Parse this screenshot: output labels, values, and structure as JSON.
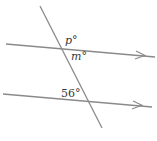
{
  "figure": {
    "type": "parallel-lines-transversal",
    "line_color": "#8a8a8a",
    "text_color": "#3a3a3a",
    "labels": {
      "p": "p°",
      "m": "m°",
      "given": "56°"
    },
    "lines": {
      "transversal": {
        "x1": 40,
        "y1": 6,
        "x2": 102,
        "y2": 128
      },
      "upper_parallel": {
        "x1": 6,
        "y1": 44,
        "x2": 155,
        "y2": 57
      },
      "lower_parallel": {
        "x1": 3,
        "y1": 94,
        "x2": 152,
        "y2": 107
      }
    }
  }
}
